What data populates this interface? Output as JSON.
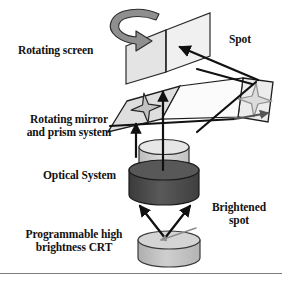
{
  "figure": {
    "background_color": "#ffffff",
    "width": 282,
    "height": 282
  },
  "labels": {
    "rotating_screen": "Rotating screen",
    "rotating_mirror": "Rotating mirror\nand prism system",
    "optical_system": "Optical System",
    "crt": "Programmable high\nbrightness CRT",
    "spot": "Spot",
    "brightened_spot": "Brightened\nspot"
  },
  "components": [
    {
      "id": "rotating-screen-panel-left",
      "name": "Rotating screen panel (left)",
      "shape": "parallelogram",
      "fill": "#e2e2e2",
      "stroke": "#2b2b2b"
    },
    {
      "id": "rotating-screen-panel-right",
      "name": "Rotating screen panel (right)",
      "shape": "parallelogram",
      "fill": "#eeeeee",
      "stroke": "#2b2b2b"
    },
    {
      "id": "rotation-arrow",
      "name": "Rotation direction arrow",
      "shape": "curved-hook-arrow",
      "fill": "#8c8c8c",
      "stroke": "#2b2b2b"
    },
    {
      "id": "mirror-prism-panel-left",
      "name": "Rotating mirror and prism panel (left)",
      "shape": "parallelogram",
      "fill": "#dedede",
      "stroke": "#1e1e1e"
    },
    {
      "id": "mirror-prism-panel-right",
      "name": "Rotating mirror and prism panel (right)",
      "shape": "parallelogram",
      "fill": "#e8e8e8",
      "stroke": "#1e1e1e"
    },
    {
      "id": "star-spot-left",
      "name": "Four point star spot (left panel)",
      "shape": "four-point-star",
      "fill": "#c4c4c4",
      "stroke": "#2a2a2a"
    },
    {
      "id": "star-spot-right",
      "name": "Four point star spot (right panel)",
      "shape": "four-point-star",
      "fill": "#d8d8d8",
      "stroke": "#8a8a8a"
    },
    {
      "id": "optical-system-upper-lens",
      "name": "Optical system upper lens barrel",
      "shape": "cylinder",
      "fill": "#d0d0d0",
      "stroke": "#303030"
    },
    {
      "id": "optical-system-lower-housing",
      "name": "Optical system lower housing",
      "shape": "cylinder",
      "fill": "#4f4f4f",
      "stroke": "#1a1a1a"
    },
    {
      "id": "crt-cylinder",
      "name": "Programmable high brightness CRT",
      "shape": "cylinder",
      "fill": "#bdbdbd",
      "stroke": "#3a3a3a"
    }
  ],
  "rays": [
    {
      "id": "ray-crt-to-optics-left",
      "name": "CRT to optics left ray",
      "style": "solid-arrow",
      "color": "#111111"
    },
    {
      "id": "ray-crt-to-optics-right",
      "name": "CRT to optics right ray",
      "style": "solid-arrow",
      "color": "#111111"
    },
    {
      "id": "ray-optics-to-prism-left",
      "name": "Optics to prism left ray",
      "style": "solid-arrow",
      "color": "#111111"
    },
    {
      "id": "ray-optics-to-prism-right",
      "name": "Optics to prism right ray",
      "style": "solid-arrow",
      "color": "#111111"
    },
    {
      "id": "ray-prism-to-screen",
      "name": "Prism to rotating screen ray",
      "style": "solid-arrow",
      "color": "#111111"
    },
    {
      "id": "ray-prism-cross",
      "name": "Prism crossing ray",
      "style": "solid-line",
      "color": "#111111"
    },
    {
      "id": "ray-panel-horizontal",
      "name": "Horizontal panel ray",
      "style": "solid-arrow",
      "color": "#111111"
    },
    {
      "id": "ray-brightened-spot-pointer",
      "name": "Brightened spot pointer",
      "style": "thin-arrow",
      "color": "#8d8d8d"
    }
  ],
  "colors": {
    "ink": "#121212",
    "panel_light": "#e8e8e8",
    "panel_mid": "#c9c9c9",
    "housing_dark": "#4f4f4f",
    "arrow_gray": "#8c8c8c"
  }
}
